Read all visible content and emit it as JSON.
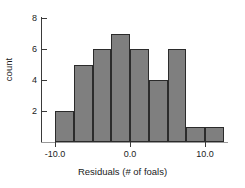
{
  "chart_data": {
    "type": "bar",
    "title": "",
    "subtitle": "",
    "xlabel": "Residuals (# of foals)",
    "ylabel": "count",
    "grid": false,
    "legend": false,
    "bin_edges": [
      -10,
      -7.5,
      -5,
      -2.5,
      0,
      2.5,
      5,
      7.5,
      10,
      12.5
    ],
    "categories": [
      "-10 to -7.5",
      "-7.5 to -5",
      "-5 to -2.5",
      "-2.5 to 0",
      "0 to 2.5",
      "2.5 to 5",
      "5 to 7.5",
      "7.5 to 10",
      "10 to 12.5"
    ],
    "values": [
      2,
      5,
      6,
      7,
      6,
      4,
      6,
      1,
      1
    ],
    "xlim": [
      -12.5,
      14
    ],
    "ylim": [
      0,
      8
    ],
    "xticks": [
      -10,
      0,
      10
    ],
    "xtick_labels": [
      "-10.0",
      "0.0",
      "10.0"
    ],
    "yticks": [
      2,
      4,
      6,
      8
    ],
    "ytick_labels": [
      "2",
      "4",
      "6",
      "8"
    ],
    "bar_fill_color": "#7f7f7f",
    "bar_edge_color": "#2b2b2b",
    "axis_color": "#3a3a3a",
    "background_color": "#ffffff"
  }
}
